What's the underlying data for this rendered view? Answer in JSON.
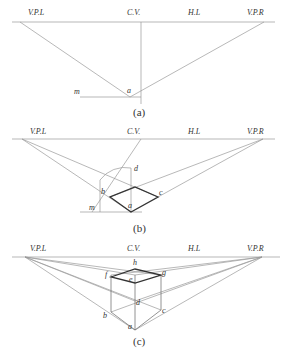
{
  "figure": {
    "panels": [
      {
        "id": "a",
        "caption": "(a)",
        "labels": {
          "vpl": "V.P.L",
          "cv": "C.V.",
          "hl": "H.L",
          "vpr": "V.P.R",
          "m": "m",
          "a": "a"
        }
      },
      {
        "id": "b",
        "caption": "(b)",
        "labels": {
          "vpl": "V.P.L",
          "cv": "C.V.",
          "hl": "H.L",
          "vpr": "V.P.R",
          "m": "m",
          "a": "a",
          "b": "b",
          "c": "c",
          "d": "d"
        }
      },
      {
        "id": "c",
        "caption": "(c)",
        "labels": {
          "vpl": "V.P.L",
          "cv": "C.V.",
          "hl": "H.L",
          "vpr": "V.P.R",
          "h": "h",
          "f": "f",
          "g": "g",
          "e": "e",
          "d": "d",
          "c": "c",
          "b": "b",
          "a": "a"
        }
      }
    ]
  }
}
